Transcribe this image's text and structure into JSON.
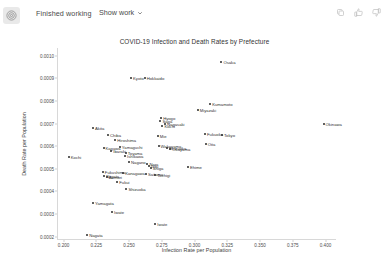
{
  "header": {
    "status": "Finished working",
    "show_work_label": "Show work",
    "avatar_icon": "assistant-spiral-icon",
    "actions": [
      {
        "name": "copy-icon",
        "label": "Copy"
      },
      {
        "name": "thumbs-up-icon",
        "label": "Good response"
      },
      {
        "name": "thumbs-down-icon",
        "label": "Bad response"
      }
    ]
  },
  "chart_data": {
    "type": "scatter",
    "title": "COVID-19 Infection and Death Rates by Prefecture",
    "xlabel": "Infection Rate per Population",
    "ylabel": "Death Rate per Population",
    "xlim": [
      0.195,
      0.408
    ],
    "ylim": [
      0.000185,
      0.001035
    ],
    "grid": false,
    "legend": null,
    "xticks": [
      "0.200",
      "0.225",
      "0.250",
      "0.275",
      "0.300",
      "0.325",
      "0.350",
      "0.375",
      "0.400"
    ],
    "xtick_values": [
      0.2,
      0.225,
      0.25,
      0.275,
      0.3,
      0.325,
      0.35,
      0.375,
      0.4
    ],
    "yticks": [
      "0.0002",
      "0.0003",
      "0.0004",
      "0.0005",
      "0.0006",
      "0.0007",
      "0.0008",
      "0.0009",
      "0.0010"
    ],
    "ytick_values": [
      0.0002,
      0.0003,
      0.0004,
      0.0005,
      0.0006,
      0.0007,
      0.0008,
      0.0009,
      0.001
    ],
    "marker_color": "#2b2b2b",
    "points": [
      {
        "label": "Osaka",
        "x": 0.3205,
        "y": 0.000975
      },
      {
        "label": "Kyoto",
        "x": 0.2515,
        "y": 0.0009
      },
      {
        "label": "Hokkaido",
        "x": 0.262,
        "y": 0.000902
      },
      {
        "label": "Kumamoto",
        "x": 0.312,
        "y": 0.000785
      },
      {
        "label": "Miyazaki",
        "x": 0.3025,
        "y": 0.000762
      },
      {
        "label": "Okinawa",
        "x": 0.3985,
        "y": 0.0007
      },
      {
        "label": "Hyogo",
        "x": 0.2745,
        "y": 0.000724
      },
      {
        "label": "Saga",
        "x": 0.274,
        "y": 0.00071
      },
      {
        "label": "Nagasaki",
        "x": 0.2775,
        "y": 0.0007
      },
      {
        "label": "Kochi",
        "x": 0.2755,
        "y": 0.000688
      },
      {
        "label": "Akita",
        "x": 0.2225,
        "y": 0.000682
      },
      {
        "label": "Fukuoka",
        "x": 0.308,
        "y": 0.000654
      },
      {
        "label": "Tokyo",
        "x": 0.321,
        "y": 0.000648
      },
      {
        "label": "Chiba",
        "x": 0.234,
        "y": 0.000651
      },
      {
        "label": "Mie",
        "x": 0.272,
        "y": 0.000645
      },
      {
        "label": "Hiroshima",
        "x": 0.2395,
        "y": 0.000628
      },
      {
        "label": "Oita",
        "x": 0.3085,
        "y": 0.000608
      },
      {
        "label": "Wakayama",
        "x": 0.2725,
        "y": 0.000603
      },
      {
        "label": "Yamaguchi",
        "x": 0.243,
        "y": 0.000598
      },
      {
        "label": "Kagawa",
        "x": 0.2305,
        "y": 0.000594
      },
      {
        "label": "Shizuoka",
        "x": 0.279,
        "y": 0.000592
      },
      {
        "label": "Okayama",
        "x": 0.2815,
        "y": 0.000588
      },
      {
        "label": "Ibaraki",
        "x": 0.2365,
        "y": 0.000578
      },
      {
        "label": "Toyama",
        "x": 0.2475,
        "y": 0.000572
      },
      {
        "label": "Kochi",
        "x": 0.204,
        "y": 0.000553
      },
      {
        "label": "Ishikawa",
        "x": 0.247,
        "y": 0.000558
      },
      {
        "label": "Nagano",
        "x": 0.25,
        "y": 0.000532
      },
      {
        "label": "Nara",
        "x": 0.264,
        "y": 0.000522
      },
      {
        "label": "Gifu",
        "x": 0.265,
        "y": 0.000512
      },
      {
        "label": "Shiga",
        "x": 0.2665,
        "y": 0.000505
      },
      {
        "label": "Ehime",
        "x": 0.295,
        "y": 0.000508
      },
      {
        "label": "Fukushima",
        "x": 0.23,
        "y": 0.000487
      },
      {
        "label": "Kanagawa",
        "x": 0.2455,
        "y": 0.000482
      },
      {
        "label": "Saitama",
        "x": 0.263,
        "y": 0.000478
      },
      {
        "label": "Tochigi",
        "x": 0.27,
        "y": 0.000474
      },
      {
        "label": "Niigata",
        "x": 0.231,
        "y": 0.00047
      },
      {
        "label": "Aomori",
        "x": 0.233,
        "y": 0.000463
      },
      {
        "label": "Fukui",
        "x": 0.241,
        "y": 0.00044
      },
      {
        "label": "Shizuoka",
        "x": 0.248,
        "y": 0.000412
      },
      {
        "label": "Yamagata",
        "x": 0.2225,
        "y": 0.000348
      },
      {
        "label": "Iwate",
        "x": 0.237,
        "y": 0.00031
      },
      {
        "label": "Iwate",
        "x": 0.27,
        "y": 0.000255
      },
      {
        "label": "Nagata",
        "x": 0.218,
        "y": 0.000205
      }
    ]
  }
}
